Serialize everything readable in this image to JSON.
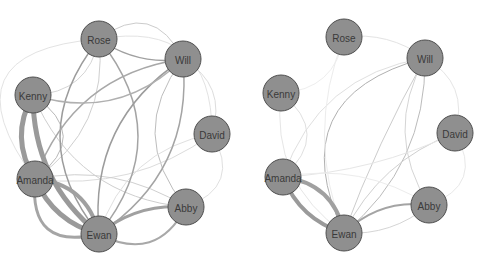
{
  "diagram": {
    "type": "network",
    "layout": "circular",
    "node_color": "#8f8f8f",
    "node_border_color": "#505050",
    "label_color": "#3a3a3a",
    "nodes": [
      "Rose",
      "Will",
      "Kenny",
      "David",
      "Amanda",
      "Abby",
      "Ewan"
    ],
    "panels": [
      {
        "name": "left-network",
        "positions": {
          "Rose": [
            99,
            39
          ],
          "Will": [
            183,
            59
          ],
          "Kenny": [
            33,
            95
          ],
          "David": [
            212,
            134
          ],
          "Amanda": [
            35,
            179
          ],
          "Abby": [
            186,
            207
          ],
          "Ewan": [
            99,
            234
          ]
        },
        "edges": [
          {
            "s": "Kenny",
            "t": "Ewan",
            "w": 5,
            "c": "#9a9a9a",
            "bend": 0.12
          },
          {
            "s": "Kenny",
            "t": "Amanda",
            "w": 5,
            "c": "#9a9a9a",
            "bend": 0.15
          },
          {
            "s": "Amanda",
            "t": "Ewan",
            "w": 5,
            "c": "#9a9a9a",
            "bend": 0.12
          },
          {
            "s": "Amanda",
            "t": "Ewan",
            "w": 4,
            "c": "#a0a0a0",
            "bend": -0.18
          },
          {
            "s": "Amanda",
            "t": "Ewan",
            "w": 3,
            "c": "#a5a5a5",
            "bend": 0.35
          },
          {
            "s": "Abby",
            "t": "Ewan",
            "w": 3,
            "c": "#a0a0a0",
            "bend": 0.1
          },
          {
            "s": "Ewan",
            "t": "Abby",
            "w": 2,
            "c": "#a8a8a8",
            "bend": 0.25
          },
          {
            "s": "Rose",
            "t": "Ewan",
            "w": 1.5,
            "c": "#9c9c9c",
            "bend": 0.2
          },
          {
            "s": "Rose",
            "t": "Ewan",
            "w": 1.5,
            "c": "#a4a4a4",
            "bend": -0.2
          },
          {
            "s": "Rose",
            "t": "Will",
            "w": 1.5,
            "c": "#a0a0a0",
            "bend": 0.1
          },
          {
            "s": "Rose",
            "t": "Will",
            "w": 1,
            "c": "#cccccc",
            "bend": -0.3
          },
          {
            "s": "Will",
            "t": "Ewan",
            "w": 1.5,
            "c": "#9c9c9c",
            "bend": 0.15
          },
          {
            "s": "Will",
            "t": "Ewan",
            "w": 1.5,
            "c": "#a4a4a4",
            "bend": -0.15
          },
          {
            "s": "Will",
            "t": "Amanda",
            "w": 1.5,
            "c": "#a8a8a8",
            "bend": 0.15
          },
          {
            "s": "Will",
            "t": "Kenny",
            "w": 1.5,
            "c": "#b0b0b0",
            "bend": -0.15
          },
          {
            "s": "Will",
            "t": "Abby",
            "w": 1,
            "c": "#bdbdbd",
            "bend": 0.2
          },
          {
            "s": "Will",
            "t": "David",
            "w": 1,
            "c": "#dddddd",
            "bend": -0.2
          },
          {
            "s": "Kenny",
            "t": "Rose",
            "w": 1,
            "c": "#d5d5d5",
            "bend": 0.2
          },
          {
            "s": "Kenny",
            "t": "Abby",
            "w": 1,
            "c": "#cfcfcf",
            "bend": 0.15
          },
          {
            "s": "Kenny",
            "t": "Amanda",
            "w": 1,
            "c": "#b8b8b8",
            "bend": -0.35
          },
          {
            "s": "Amanda",
            "t": "David",
            "w": 1,
            "c": "#dcdcdc",
            "bend": 0.1
          },
          {
            "s": "Amanda",
            "t": "Abby",
            "w": 1,
            "c": "#d0d0d0",
            "bend": -0.1
          },
          {
            "s": "Amanda",
            "t": "Rose",
            "w": 1,
            "c": "#cfcfcf",
            "bend": 0.15
          },
          {
            "s": "David",
            "t": "Abby",
            "w": 1,
            "c": "#e0e0e0",
            "bend": -0.3
          },
          {
            "s": "David",
            "t": "Ewan",
            "w": 1,
            "c": "#e0e0e0",
            "bend": 0.15
          },
          {
            "s": "Rose",
            "t": "David",
            "w": 1,
            "c": "#e3e3e3",
            "bend": -0.3
          },
          {
            "s": "Rose",
            "t": "Amanda",
            "w": 1,
            "c": "#e3e3e3",
            "bend": 0.45
          }
        ]
      },
      {
        "name": "right-network",
        "positions": {
          "Rose": [
            344,
            37
          ],
          "Will": [
            425,
            58
          ],
          "Kenny": [
            281,
            93
          ],
          "David": [
            455,
            133
          ],
          "Amanda": [
            283,
            177
          ],
          "Abby": [
            429,
            205
          ],
          "Ewan": [
            344,
            233
          ]
        },
        "edges": [
          {
            "s": "Amanda",
            "t": "Ewan",
            "w": 4,
            "c": "#9a9a9a",
            "bend": 0.12
          },
          {
            "s": "Amanda",
            "t": "Ewan",
            "w": 4,
            "c": "#a0a0a0",
            "bend": -0.18
          },
          {
            "s": "Ewan",
            "t": "Abby",
            "w": 2,
            "c": "#a4a4a4",
            "bend": -0.12
          },
          {
            "s": "Ewan",
            "t": "Abby",
            "w": 1,
            "c": "#d5d5d5",
            "bend": 0.1
          },
          {
            "s": "Will",
            "t": "Ewan",
            "w": 1,
            "c": "#b0b0b0",
            "bend": 0.3
          },
          {
            "s": "Will",
            "t": "Ewan",
            "w": 1,
            "c": "#bbbbbb",
            "bend": -0.12
          },
          {
            "s": "Will",
            "t": "Ewan",
            "w": 1,
            "c": "#cccccc",
            "bend": 0.02
          },
          {
            "s": "Will",
            "t": "Abby",
            "w": 1,
            "c": "#d5d5d5",
            "bend": 0.15
          },
          {
            "s": "Will",
            "t": "Amanda",
            "w": 1,
            "c": "#e0e0e0",
            "bend": 0.15
          },
          {
            "s": "Will",
            "t": "Rose",
            "w": 1,
            "c": "#e3e3e3",
            "bend": 0.1
          },
          {
            "s": "Will",
            "t": "David",
            "w": 1,
            "c": "#e5e5e5",
            "bend": -0.2
          },
          {
            "s": "David",
            "t": "Ewan",
            "w": 1,
            "c": "#d0d0d0",
            "bend": 0.1
          },
          {
            "s": "David",
            "t": "Amanda",
            "w": 1,
            "c": "#e6e6e6",
            "bend": -0.05
          },
          {
            "s": "David",
            "t": "Abby",
            "w": 1,
            "c": "#e8e8e8",
            "bend": -0.3
          },
          {
            "s": "Kenny",
            "t": "Amanda",
            "w": 1,
            "c": "#e0e0e0",
            "bend": -0.3
          },
          {
            "s": "Kenny",
            "t": "Ewan",
            "w": 1,
            "c": "#e6e6e6",
            "bend": 0.15
          },
          {
            "s": "Kenny",
            "t": "Rose",
            "w": 1,
            "c": "#eeeeee",
            "bend": 0.2
          },
          {
            "s": "Rose",
            "t": "Ewan",
            "w": 1,
            "c": "#ececec",
            "bend": 0.1
          },
          {
            "s": "Amanda",
            "t": "Abby",
            "w": 1,
            "c": "#ececec",
            "bend": -0.1
          }
        ]
      }
    ]
  }
}
